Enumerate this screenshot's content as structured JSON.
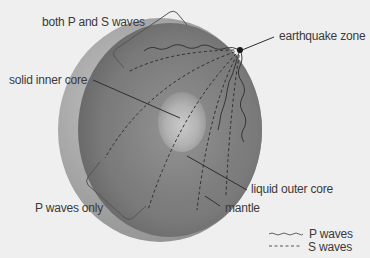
{
  "diagram": {
    "labels": {
      "both_waves": "both P and S waves",
      "earthquake_zone": "earthquake zone",
      "inner_core": "solid inner core",
      "outer_core": "liquid outer core",
      "mantle": "mantle",
      "p_only": "P waves only"
    },
    "legend": {
      "p_waves": "P waves",
      "s_waves": "S waves",
      "p_style": "wavy-solid",
      "s_style": "dashed"
    },
    "colors": {
      "background": "#efefef",
      "crust_rim": "#a8a8a8",
      "mantle": "#7a7a7a",
      "outer_core": "#8a8a8a",
      "inner_core": "#bdbdbd",
      "line": "#2e2e2e",
      "text": "#3a3a3a"
    }
  }
}
